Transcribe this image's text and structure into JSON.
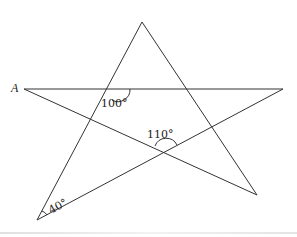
{
  "diagram": {
    "type": "five-pointed star (pentagram) geometry figure",
    "point_labels": [
      {
        "name": "A",
        "x": 14,
        "y": 91
      }
    ],
    "vertices": {
      "A": [
        24,
        89
      ],
      "top": [
        142,
        22
      ],
      "right": [
        283,
        89
      ],
      "bottom_right": [
        257,
        195
      ],
      "bottom_left": [
        37,
        220
      ]
    },
    "segments": [
      [
        "A",
        "right"
      ],
      [
        "A",
        "bottom_right"
      ],
      [
        "bottom_left",
        "top"
      ],
      [
        "top",
        "bottom_right"
      ],
      [
        "bottom_left",
        "right"
      ]
    ],
    "angle_labels": [
      {
        "text": "100°",
        "x": 101,
        "y": 106
      },
      {
        "text": "110°",
        "x": 148,
        "y": 138
      },
      {
        "text": "40°",
        "x": 52,
        "y": 214
      }
    ],
    "colors": {
      "line": "#333333",
      "background": "#ffffff"
    }
  }
}
